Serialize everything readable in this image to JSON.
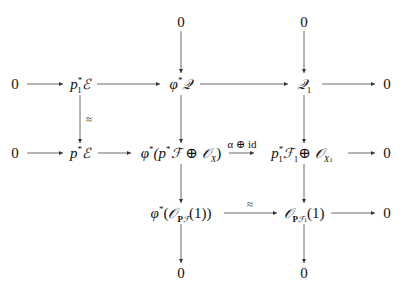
{
  "diagram": {
    "type": "commutative-diagram",
    "nodes": {
      "top_zero_col3": "0",
      "top_zero_col4": "0",
      "r1_zero_left": "0",
      "r1_p1E": {
        "base": "p",
        "sup": "*",
        "sub": "1",
        "obj": "ℰ"
      },
      "r1_phiQ": {
        "base": "φ",
        "sup": "*",
        "obj": "𝒬"
      },
      "r1_Q1": {
        "obj": "𝒬",
        "sub": "1"
      },
      "r1_zero_right": "0",
      "r2_zero_left": "0",
      "r2_pE": {
        "base": "p",
        "sup": "*",
        "obj": "ℰ"
      },
      "r2_phi_sum": {
        "text_pre": "φ",
        "sup": "*",
        "open": "(p",
        "sup2": "*",
        "F": "ℱ",
        "oplus": "⊕",
        "O": "𝒪",
        "sub": "X",
        "close": ")"
      },
      "r2_p1F1_sum": {
        "base": "p",
        "sup": "*",
        "sub": "1",
        "F": "ℱ",
        "Fsub": "1",
        "oplus": "⊕",
        "O": "𝒪",
        "Osub": "X",
        "Osubsub": "1"
      },
      "r2_zero_right": "0",
      "r3_phiO": {
        "pre": "φ",
        "sup": "*",
        "open": "(",
        "O": "𝒪",
        "sub_bold": "P",
        "sub_F": "ℱ",
        "arg": "(1))"
      },
      "r3_O_PF1": {
        "O": "𝒪",
        "sub_bold": "P",
        "sub_F": "ℱ",
        "sub_F_sub": "1",
        "arg": "(1)"
      },
      "r3_zero_right": "0",
      "bottom_zero_col3": "0",
      "bottom_zero_col4": "0"
    },
    "arrow_labels": {
      "vertical_iso": "≈",
      "horizontal_alpha": "α ⊕ id",
      "horizontal_iso": "≈"
    },
    "colors": {
      "ink": "#111111",
      "background": "#ffffff"
    }
  }
}
